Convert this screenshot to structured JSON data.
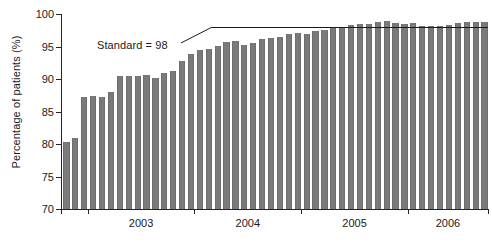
{
  "chart_data": {
    "type": "bar",
    "title": "",
    "xlabel": "",
    "ylabel": "Percentage of patients (%)",
    "ylim": [
      70,
      100
    ],
    "ytick_values": [
      70,
      75,
      80,
      85,
      90,
      95,
      100
    ],
    "ytick_labels": [
      "70",
      "75",
      "80",
      "85",
      "90",
      "95",
      "100"
    ],
    "grid": false,
    "legend": null,
    "bar_color": "#7a7a7a",
    "x_axis_note": "monthly bars, year tick labels centred under each year block",
    "xtick_labels": [
      "2003",
      "2004",
      "2005",
      "2006"
    ],
    "categories": [
      "2002-10",
      "2002-11",
      "2002-12",
      "2003-01",
      "2003-02",
      "2003-03",
      "2003-04",
      "2003-05",
      "2003-06",
      "2003-07",
      "2003-08",
      "2003-09",
      "2003-10",
      "2003-11",
      "2003-12",
      "2004-01",
      "2004-02",
      "2004-03",
      "2004-04",
      "2004-05",
      "2004-06",
      "2004-07",
      "2004-08",
      "2004-09",
      "2004-10",
      "2004-11",
      "2004-12",
      "2005-01",
      "2005-02",
      "2005-03",
      "2005-04",
      "2005-05",
      "2005-06",
      "2005-07",
      "2005-08",
      "2005-09",
      "2005-10",
      "2005-11",
      "2005-12",
      "2006-01",
      "2006-02",
      "2006-03",
      "2006-04",
      "2006-05",
      "2006-06",
      "2006-07",
      "2006-08",
      "2006-09"
    ],
    "values": [
      80.3,
      81.0,
      87.3,
      87.4,
      87.3,
      88.0,
      90.5,
      90.5,
      90.4,
      90.6,
      90.2,
      90.9,
      91.3,
      92.8,
      93.9,
      94.4,
      94.6,
      95.1,
      95.7,
      95.8,
      95.3,
      95.6,
      96.1,
      96.3,
      96.4,
      96.9,
      97.1,
      97.0,
      97.4,
      97.5,
      97.8,
      98.0,
      98.3,
      98.4,
      98.5,
      98.8,
      98.9,
      98.6,
      98.4,
      98.6,
      98.1,
      98.2,
      98.2,
      98.3,
      98.6,
      98.8,
      98.8,
      98.8
    ],
    "annotations": [
      {
        "name": "standard-line",
        "label": "Standard = 98",
        "value": 98,
        "starts_at_category": "2004-03",
        "description": "horizontal reference line at 98% drawn from early 2004 to the right edge, with an angled leader connecting the text label"
      }
    ]
  },
  "caption": ""
}
